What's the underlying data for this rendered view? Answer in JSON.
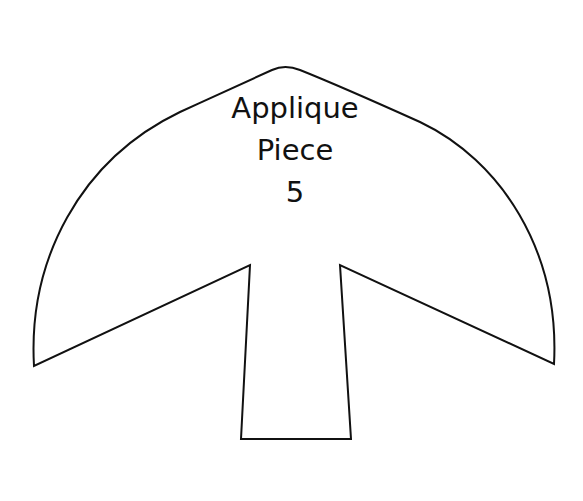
{
  "figure": {
    "type": "applique-template",
    "shape": "mushroom / anchor-like piece with rounded cap and rectangular stem",
    "stroke_color": "#111111",
    "fill_color": "#ffffff",
    "background": "#ffffff"
  },
  "label": {
    "line1": "Applique",
    "line2": "Piece",
    "line3": "5"
  }
}
